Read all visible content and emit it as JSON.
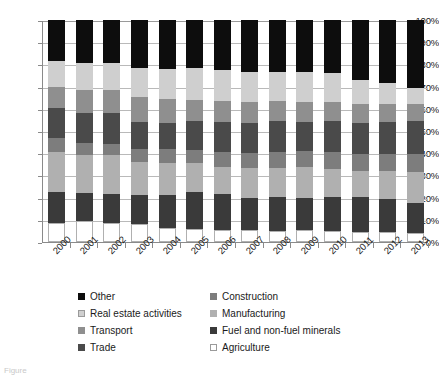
{
  "chart_data": {
    "type": "bar",
    "stacked": true,
    "normalized": true,
    "title": "",
    "subtitle": "",
    "xlabel": "",
    "ylabel": "",
    "ylim": [
      0,
      100
    ],
    "ytick_values": [
      0,
      10,
      20,
      30,
      40,
      50,
      60,
      70,
      80,
      90,
      100
    ],
    "ytick_labels": [
      "0%",
      "10%",
      "20%",
      "30%",
      "40%",
      "50%",
      "60%",
      "70%",
      "80%",
      "90%",
      "100%"
    ],
    "grid": true,
    "grid_axis": "y",
    "legend_position": "bottom",
    "legend_columns": 2,
    "stack_order_bottom_to_top": [
      "Agriculture",
      "Fuel and non-fuel minerals",
      "Manufacturing",
      "Construction",
      "Trade",
      "Transport",
      "Real estate activities",
      "Other"
    ],
    "categories": [
      "2000",
      "2001",
      "2002",
      "2003",
      "2004",
      "2005",
      "2006",
      "2007",
      "2008",
      "2009",
      "2010",
      "2011",
      "2012",
      "2013"
    ],
    "series": [
      {
        "name": "Agriculture",
        "color": "#ffffff",
        "values": [
          8.5,
          9.5,
          8.5,
          8.0,
          6.5,
          6.0,
          5.5,
          5.5,
          5.0,
          5.5,
          5.0,
          4.5,
          4.5,
          4.0
        ]
      },
      {
        "name": "Fuel and non-fuel minerals",
        "color": "#3a3a3a",
        "values": [
          14.0,
          12.5,
          13.0,
          13.0,
          14.5,
          16.5,
          16.0,
          14.5,
          15.5,
          14.5,
          15.5,
          16.0,
          15.0,
          13.5
        ]
      },
      {
        "name": "Manufacturing",
        "color": "#b0b0b0",
        "values": [
          18.0,
          17.0,
          17.5,
          15.0,
          14.5,
          13.0,
          12.5,
          13.5,
          13.0,
          14.0,
          12.5,
          11.5,
          12.5,
          14.0
        ]
      },
      {
        "name": "Construction",
        "color": "#7d7d7d",
        "values": [
          6.5,
          5.5,
          5.0,
          6.0,
          6.5,
          6.0,
          6.5,
          6.5,
          7.0,
          7.0,
          7.5,
          7.5,
          7.5,
          8.0
        ]
      },
      {
        "name": "Trade",
        "color": "#4a4a4a",
        "values": [
          13.5,
          13.5,
          14.0,
          12.0,
          11.5,
          13.0,
          13.5,
          13.5,
          14.0,
          13.0,
          14.0,
          14.0,
          14.5,
          15.0
        ]
      },
      {
        "name": "Transport",
        "color": "#8f8f8f",
        "values": [
          9.5,
          10.5,
          10.5,
          11.5,
          11.0,
          9.5,
          9.5,
          9.5,
          9.0,
          9.0,
          8.5,
          8.5,
          8.0,
          7.5
        ]
      },
      {
        "name": "Real estate activities",
        "color": "#cfcfcf",
        "values": [
          11.5,
          12.0,
          12.0,
          13.0,
          13.5,
          14.5,
          14.0,
          13.5,
          13.0,
          13.5,
          13.0,
          11.0,
          9.5,
          7.5
        ]
      },
      {
        "name": "Other",
        "color": "#0d0d0d",
        "values": [
          18.5,
          19.5,
          19.5,
          21.5,
          22.0,
          21.5,
          22.5,
          23.5,
          23.5,
          23.5,
          24.0,
          27.0,
          28.5,
          30.5
        ]
      }
    ]
  },
  "legend": {
    "left_column": [
      {
        "label": "Other",
        "color": "#0d0d0d",
        "swatch": "filled"
      },
      {
        "label": "Real estate activities",
        "color": "#cfcfcf",
        "swatch": "outlined"
      },
      {
        "label": "Transport",
        "color": "#8f8f8f",
        "swatch": "filled"
      },
      {
        "label": "Trade",
        "color": "#4a4a4a",
        "swatch": "filled"
      }
    ],
    "right_column": [
      {
        "label": "Construction",
        "color": "#7d7d7d",
        "swatch": "filled"
      },
      {
        "label": "Manufacturing",
        "color": "#b0b0b0",
        "swatch": "filled"
      },
      {
        "label": "Fuel and non-fuel minerals",
        "color": "#3a3a3a",
        "swatch": "filled"
      },
      {
        "label": "Agriculture",
        "color": "#ffffff",
        "swatch": "outlined"
      }
    ]
  },
  "caption": {
    "text": "Figure"
  },
  "colors": {
    "axis": "#8a8a8a",
    "gridline": "#b9b9b9",
    "text": "#1a1a1a",
    "background": "#ffffff"
  }
}
